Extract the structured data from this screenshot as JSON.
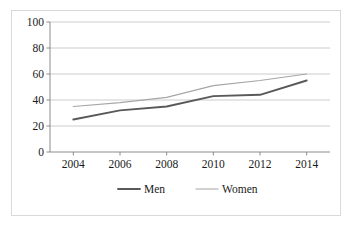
{
  "chart_data": {
    "type": "line",
    "title": "",
    "subtitle": "",
    "xlabel": "",
    "ylabel": "",
    "x": [
      2004,
      2006,
      2008,
      2010,
      2012,
      2014
    ],
    "categories": [
      "2004",
      "2006",
      "2008",
      "2010",
      "2012",
      "2014"
    ],
    "series": [
      {
        "name": "Men",
        "values": [
          25,
          32,
          35,
          43,
          44,
          55
        ],
        "color": "#595959",
        "line_width": 1.9
      },
      {
        "name": "Women",
        "values": [
          35,
          38,
          42,
          51,
          55,
          60
        ],
        "color": "#a6a6a6",
        "line_width": 1.2
      }
    ],
    "xlim": [
      2003,
      2015
    ],
    "ylim": [
      0,
      100
    ],
    "yticks": [
      0,
      20,
      40,
      60,
      80,
      100
    ],
    "ytick_labels": [
      "0",
      "20",
      "40",
      "60",
      "80",
      "100"
    ],
    "xtick_labels": [
      "2004",
      "2006",
      "2008",
      "2010",
      "2012",
      "2014"
    ],
    "grid": {
      "horizontal": true,
      "vertical": false,
      "color": "#bfbfbf"
    },
    "legend": {
      "position": "bottom-center",
      "entries": [
        "Men",
        "Women"
      ]
    },
    "axis_color": "#808080",
    "plot_border_color": "#d9d9d9",
    "background": "#ffffff"
  },
  "figure": {
    "border_color": "#d9d9d9",
    "background_color": "#ffffff"
  }
}
